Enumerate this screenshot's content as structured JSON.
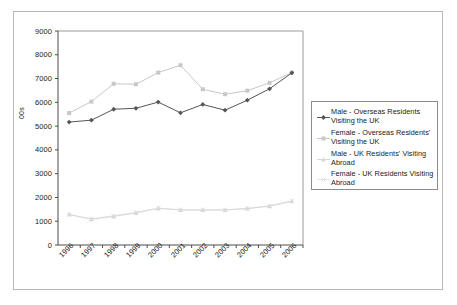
{
  "chart_data": {
    "type": "line",
    "title": "",
    "subtitle": "",
    "xlabel": "",
    "ylabel": "00s",
    "ylim": [
      0,
      9000
    ],
    "ytick_step": 1000,
    "yticks": [
      "9000",
      "8000",
      "7000",
      "6000",
      "5000",
      "4000",
      "3000",
      "2000",
      "1000",
      "0"
    ],
    "grid": false,
    "legend_position": "right",
    "categories": [
      "1996",
      "1997",
      "1998",
      "1999",
      "2000",
      "2001",
      "2002",
      "2003",
      "2004",
      "2005",
      "2006"
    ],
    "series": [
      {
        "name": "Male - Overseas Residents Visiting the UK",
        "color": "#555555",
        "marker": "diamond",
        "values": [
          5170,
          5250,
          5710,
          5750,
          6010,
          5560,
          5910,
          5670,
          6090,
          6570,
          7240
        ]
      },
      {
        "name": "Female - Overseas Residents' Visiting the UK",
        "color": "#c8c8c8",
        "marker": "square",
        "values": [
          5550,
          6030,
          6780,
          6760,
          7250,
          7560,
          6550,
          6340,
          6490,
          6820,
          7250
        ]
      },
      {
        "name": "Male - UK Residents' Visiting Abroad",
        "color": "#d9d9d9",
        "marker": "triangle",
        "values": [
          1290,
          1080,
          1200,
          1350,
          1540,
          1470,
          1470,
          1470,
          1530,
          1630,
          1840
        ]
      },
      {
        "name": "Female - UK Residents Visiting Abroad",
        "color": "#e2e2e2",
        "marker": "cross",
        "values": [
          1270,
          1100,
          1230,
          1370,
          1550,
          1480,
          1480,
          1480,
          1540,
          1650,
          1860
        ]
      }
    ]
  },
  "legend": {
    "entries": [
      "Male - Overseas Residents Visiting the UK",
      "Female - Overseas Residents' Visiting the UK",
      "Male - UK Residents' Visiting Abroad",
      "Female - UK Residents Visiting Abroad"
    ]
  },
  "axes": {
    "y_title": "00s"
  }
}
